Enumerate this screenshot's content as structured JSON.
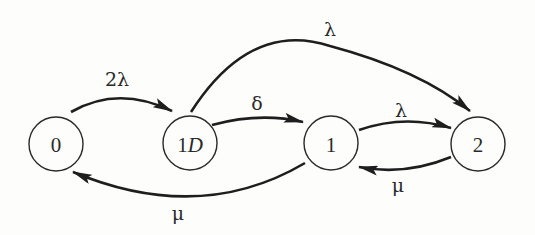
{
  "diagram": {
    "type": "state-transition",
    "states": [
      {
        "id": "0",
        "label": "0",
        "label_num": "0",
        "label_sub": ""
      },
      {
        "id": "1D",
        "label": "1D",
        "label_num": "1",
        "label_sub": "D"
      },
      {
        "id": "1",
        "label": "1",
        "label_num": "1",
        "label_sub": ""
      },
      {
        "id": "2",
        "label": "2",
        "label_num": "2",
        "label_sub": ""
      }
    ],
    "transitions": [
      {
        "from": "0",
        "to": "1D",
        "label": "2λ"
      },
      {
        "from": "1D",
        "to": "2",
        "label": "λ"
      },
      {
        "from": "1D",
        "to": "1",
        "label": "δ"
      },
      {
        "from": "1",
        "to": "2",
        "label": "λ"
      },
      {
        "from": "2",
        "to": "1",
        "label": "μ"
      },
      {
        "from": "1",
        "to": "0",
        "label": "μ"
      }
    ],
    "colors": {
      "stroke": "#1e1e1e",
      "background": "#fdfdfc"
    }
  }
}
